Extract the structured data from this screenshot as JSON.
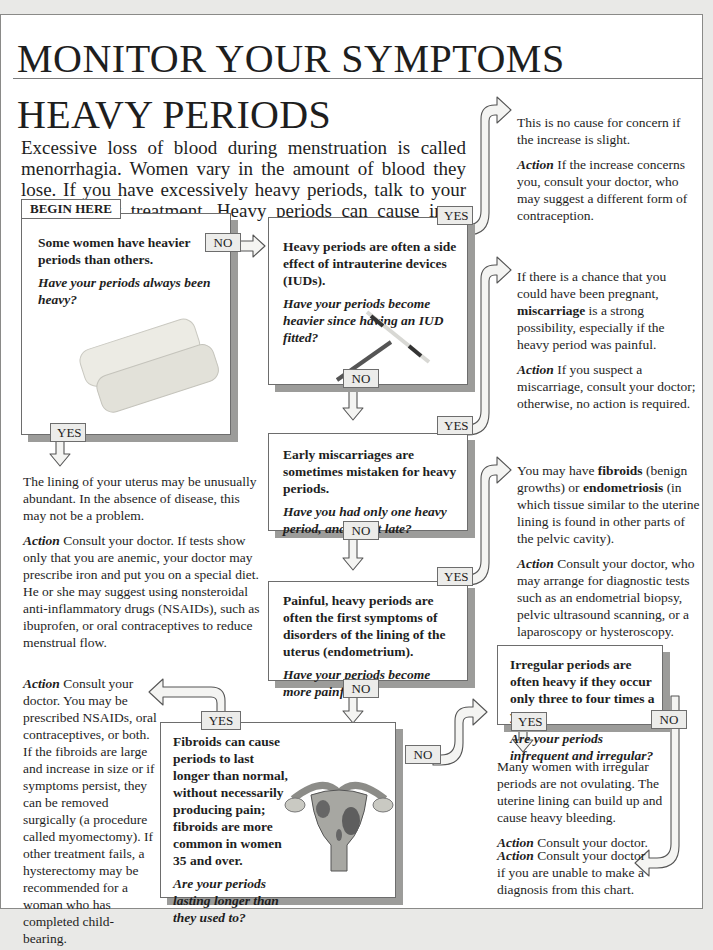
{
  "header": {
    "title": "MONITOR YOUR SYMPTOMS",
    "subtitle": "HEAVY PERIODS",
    "intro": "Excessive loss of blood during menstruation is called menorrhagia. Women vary in the amount of blood they lose. If you have excessively heavy periods, talk to your doctor about treatment. Heavy periods can cause  iron-deficiency anemia."
  },
  "labels": {
    "begin": "BEGIN HERE",
    "yes": "YES",
    "no": "NO"
  },
  "questions": [
    {
      "id": "q1",
      "statement": "Some women have heavier periods than others.",
      "question": "Have your periods always been heavy?",
      "image": "sanitary-pads-illustration"
    },
    {
      "id": "q2",
      "statement": "Heavy periods are often a side effect of intrauterine devices (IUDs).",
      "question": "Have your periods become heavier since having an IUD fitted?",
      "image": "iud-illustration"
    },
    {
      "id": "q3",
      "statement": "Early miscarriages are sometimes mistaken for heavy periods.",
      "question": "Have you had only one heavy period, and was it late?"
    },
    {
      "id": "q4",
      "statement": "Painful, heavy periods are often the first symptoms of disorders of the lining of the uterus (endometrium).",
      "question": "Have your periods become more painful?"
    },
    {
      "id": "q5",
      "statement": "Fibroids can cause periods to last longer than normal, without necessarily producing pain; fibroids are more common in women 35 and over.",
      "question": "Are your periods lasting longer than they used to?",
      "image": "uterus-with-fibroids-illustration"
    },
    {
      "id": "q6",
      "statement": "Irregular periods are often heavy if they occur only three to four times a year.",
      "question": "Are your periods infrequent and irregular?"
    }
  ],
  "outcomes": {
    "q1_yes": {
      "text": "The lining of your uterus may be unusually abundant. In the absence of disease, this may not be a problem.",
      "action_label": "Action",
      "action": " Consult your doctor. If tests show only that you are anemic, your doctor may prescribe iron and put you on a special diet. He or she may suggest using nonsteroidal anti-inflammatory drugs (NSAIDs), such as ibuprofen, or oral contraceptives to reduce menstrual flow."
    },
    "q2_yes": {
      "text": "This is no cause for concern if the increase is slight.",
      "action_label": "Action",
      "action": " If the increase concerns you, consult your doctor, who may suggest a different form of contraception."
    },
    "q3_yes": {
      "text_before": "If there is a chance that you could have been pregnant, ",
      "keyword": "miscarriage",
      "text_after": " is a strong possibility, especially if the heavy period was painful.",
      "action_label": "Action",
      "action": " If you suspect a miscarriage, consult your doctor; otherwise, no action is required."
    },
    "q4_yes": {
      "text_1": "You may have ",
      "keyword_1": "fibroids",
      "text_2": " (benign growths) or ",
      "keyword_2": "endometriosis",
      "text_3": " (in which tissue similar to the uterine lining is found in other parts of the pelvic cavity).",
      "action_label": "Action",
      "action": "  Consult your doctor, who may arrange for diagnostic tests such as an endometrial biopsy, pelvic ultrasound scanning, or a laparoscopy or hysteroscopy."
    },
    "q5_yes": {
      "action_label": "Action",
      "action": " Consult your doctor. You may be prescribed NSAIDs, oral contraceptives, or both. If the fibroids are large and increase in size or if symptoms persist, they can be removed surgically (a procedure called myomectomy). If other treatment fails, a hysterectomy may be recommended for a woman who has completed child-bearing."
    },
    "q6_yes": {
      "text": "Many women with irregular periods are not ovulating. The uterine lining can build up and cause heavy bleeding.",
      "action_label": "Action",
      "action": " Consult your doctor."
    },
    "q6_no": {
      "action_label": "Action",
      "action": " Consult your doctor if you are unable to make a diagnosis from this chart."
    }
  },
  "colors": {
    "page_bg": "#ffffff",
    "outer_bg": "#e9e9e7",
    "border": "#6d6d6d",
    "shadow": "#9c9c9a",
    "label_fill": "#ececea",
    "arrow_fill": "#f4f4f2"
  }
}
